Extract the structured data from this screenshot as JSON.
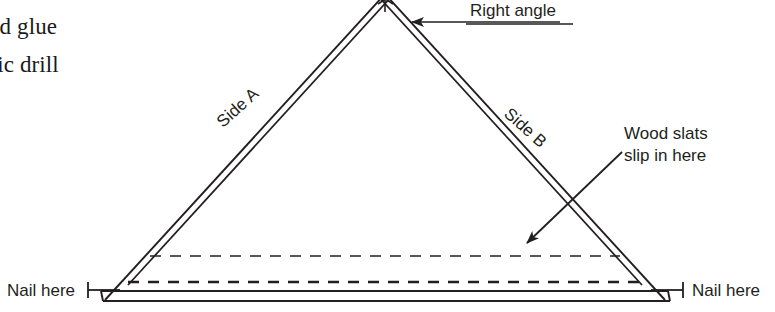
{
  "document": {
    "type": "instructional-diagram",
    "subject": "Triangular wood jig assembly diagram"
  },
  "materials_list": {
    "clipped_left": true,
    "items": [
      {
        "id": "wood-glue",
        "text": "od glue",
        "full_text": "Wood glue"
      },
      {
        "id": "electric-drill",
        "text": "tric drill",
        "full_text": "Electric drill"
      }
    ]
  },
  "diagram": {
    "labels": {
      "right_angle": "Right angle",
      "side_a": "Side A",
      "side_b": "Side B",
      "wood_slats_line1": "Wood slats",
      "wood_slats_line2": "slip in here",
      "nail_here_left": "Nail here",
      "nail_here_right": "Nail here"
    },
    "colors": {
      "line": "#231f20",
      "text": "#231f20",
      "serif_text": "#1a1a1a",
      "background": "#ffffff"
    },
    "geometry": {
      "apex_x": 385,
      "apex_y": -6,
      "left_vertex_x": 105,
      "left_vertex_y": 300,
      "right_vertex_x": 665,
      "right_vertex_y": 300,
      "base_top_y": 291,
      "base_bottom_y": 301,
      "dashed_upper_y": 256,
      "dashed_lower_y": 282
    }
  }
}
